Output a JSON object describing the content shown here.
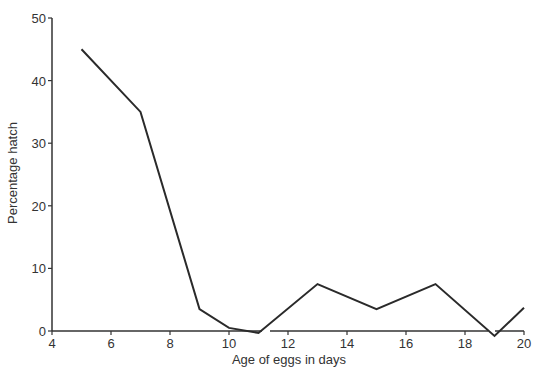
{
  "chart_data": {
    "type": "line",
    "title": "",
    "xlabel": "Age of eggs in days",
    "ylabel": "Percentage hatch",
    "xlim": [
      4,
      20
    ],
    "ylim": [
      0,
      50
    ],
    "x_ticks": [
      4,
      6,
      8,
      10,
      12,
      14,
      16,
      18,
      20
    ],
    "y_ticks": [
      0,
      10,
      20,
      30,
      40,
      50
    ],
    "grid": false,
    "legend": null,
    "series": [
      {
        "name": "Percentage hatch",
        "color": "#2a2a2a",
        "x": [
          5,
          7,
          9,
          10,
          11,
          13,
          15,
          17,
          19,
          20
        ],
        "values": [
          45,
          35,
          3.5,
          0.5,
          -0.3,
          7.5,
          3.5,
          7.5,
          -0.8,
          3.7
        ]
      }
    ]
  },
  "style": {
    "line_color": "#2a2a2a",
    "axis_color": "#333333"
  }
}
